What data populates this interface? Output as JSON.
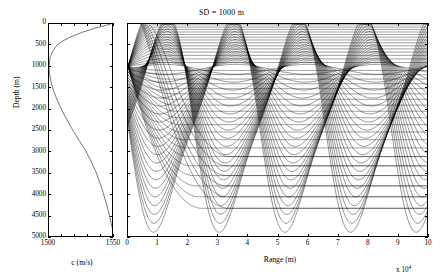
{
  "figure": {
    "title": "SD = 1000 m",
    "background": "#ffffff",
    "line_color": "#000000"
  },
  "ssp_panel": {
    "xlabel": "c (m/s)",
    "ylabel": "Depth (m)",
    "xticks": [
      "1500",
      "1550"
    ],
    "yticks": [
      "0",
      "500",
      "1000",
      "1500",
      "2000",
      "2500",
      "3000",
      "3500",
      "4000",
      "4500",
      "5000"
    ]
  },
  "ray_panel": {
    "xlabel": "Range (m)",
    "exponent": "x 10",
    "exponent_power": "4",
    "xticks": [
      "0",
      "1",
      "2",
      "3",
      "4",
      "5",
      "6",
      "7",
      "8",
      "9",
      "10"
    ]
  },
  "chart_data": [
    {
      "type": "line",
      "id": "sound-speed-profile",
      "title": "",
      "xlabel": "c (m/s)",
      "ylabel": "Depth (m)",
      "xlim": [
        1500,
        1550
      ],
      "ylim": [
        0,
        5000
      ],
      "y_inverted": true,
      "grid": false,
      "legend": false,
      "series": [
        {
          "name": "Munk sound speed profile",
          "x": [
            1549.0,
            1536.5,
            1526.0,
            1517.5,
            1511.0,
            1506.2,
            1502.8,
            1500.8,
            1500.0,
            1500.3,
            1501.5,
            1503.4,
            1505.9,
            1508.9,
            1512.2,
            1515.9,
            1519.8,
            1524.0,
            1528.3,
            1532.8,
            1537.4,
            1542.2,
            1547.1,
            1550.0
          ],
          "y": [
            0,
            100,
            200,
            300,
            400,
            500,
            650,
            800,
            1000,
            1150,
            1350,
            1550,
            1750,
            1950,
            2150,
            2350,
            2550,
            2750,
            2950,
            3200,
            3500,
            3900,
            4400,
            4800
          ]
        }
      ]
    },
    {
      "type": "line",
      "id": "ray-trace",
      "title": "SD = 1000 m",
      "xlabel": "Range (m)",
      "ylabel": "Depth (m)",
      "xlim": [
        0,
        100000
      ],
      "ylim": [
        0,
        5000
      ],
      "x_scale_exponent": 4,
      "y_inverted": true,
      "grid": false,
      "legend": false,
      "source_depth_m": 1000,
      "source_range_m": 0,
      "num_rays": 41,
      "launch_angle_range_deg": [
        -14,
        14
      ],
      "channel_axis_depth_m": 1000,
      "convergence_zone_ranges_m": [
        48000,
        96000
      ],
      "notes": "Fan of acoustic eigenrays launched from a 1000 m source in a Munk profile; rays refract between upper turning points near the surface and lower turning points near 4700 m, refocusing at convergence zones."
    }
  ]
}
